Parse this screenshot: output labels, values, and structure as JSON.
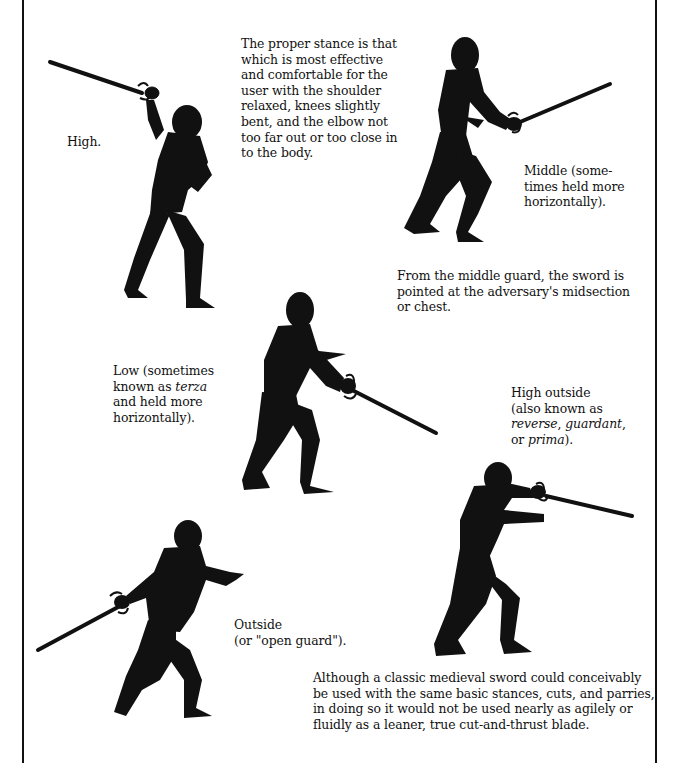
{
  "page": {
    "background": "#ffffff",
    "ink_color": "#111111"
  },
  "intro": {
    "text": "The proper stance is that which is most effective and comfortable for the user with the shoulder relaxed, knees slightly bent, and the elbow not too far out or too close in to the body.",
    "lines": [
      "The proper stance is that",
      "which is most effective",
      "and comfortable for the",
      "user with the shoulder",
      "relaxed, knees slightly",
      "bent, and the elbow not",
      "too far out or too close in",
      "to the body."
    ]
  },
  "guards": [
    {
      "id": "high",
      "caption_lines": [
        "High."
      ],
      "figure": "fencer-high-guard"
    },
    {
      "id": "middle",
      "caption_lines": [
        "Middle (some-",
        "times held more",
        "horizontally)."
      ],
      "note_lines": [
        "From the middle guard, the sword is",
        "pointed at the adversary's midsection",
        "or chest."
      ],
      "figure": "fencer-middle-guard"
    },
    {
      "id": "low",
      "caption_parts": {
        "line1": "Low (sometimes",
        "line2_pre": "known as ",
        "line2_italic": "terza",
        "line3": "and held more",
        "line4": "horizontally)."
      },
      "figure": "fencer-low-guard"
    },
    {
      "id": "high-outside",
      "caption_parts": {
        "line1": "High outside",
        "line2": "(also known as",
        "line3_italic_a": "reverse",
        "line3_sep": ", ",
        "line3_italic_b": "guardant",
        "line3_end": ",",
        "line4_pre": "or ",
        "line4_italic": "prima",
        "line4_end": ")."
      },
      "figure": "fencer-high-outside-guard"
    },
    {
      "id": "outside",
      "caption_lines": [
        "Outside",
        "(or \"open guard\")."
      ],
      "figure": "fencer-outside-guard"
    }
  ],
  "closing": {
    "lines": [
      "Although a classic medieval sword could conceivably",
      "be used with the same basic stances, cuts, and parries,",
      "in doing so it would not be used nearly as agilely or",
      "fluidly as a leaner, true cut-and-thrust blade."
    ]
  }
}
